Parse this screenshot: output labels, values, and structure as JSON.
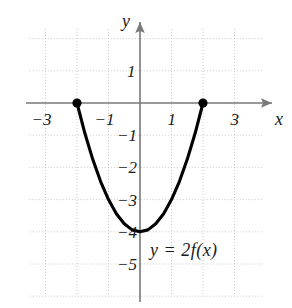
{
  "figure": {
    "title": "",
    "background_color": "#ffffff",
    "curve_color": "#000000",
    "axis_color": "#7a7a7a",
    "grid_color": "#c8c8c8",
    "text_color": "#1a1a1a"
  },
  "labels": {
    "x_axis_name": "x",
    "y_axis_name": "y",
    "curve_equation": "y = 2f(x)"
  },
  "chart_data": {
    "type": "line",
    "title": "",
    "xlabel": "x",
    "ylabel": "y",
    "xlim": [
      -3.5,
      3.9
    ],
    "ylim": [
      -6.0,
      2.3
    ],
    "grid": true,
    "grid_step": 1,
    "legend_position": "none",
    "x_ticks": [
      -3,
      -1,
      1,
      3
    ],
    "x_tick_labels": [
      "-3",
      "-1",
      "1",
      "3"
    ],
    "y_ticks": [
      1,
      -1,
      -2,
      -3,
      -4,
      -5
    ],
    "y_tick_labels": [
      "1",
      "-1",
      "-2",
      "-3",
      "-4",
      "-5"
    ],
    "series": [
      {
        "name": "y = 2f(x)",
        "type": "parabola",
        "domain": [
          -2,
          2
        ],
        "vertex": [
          0,
          -4
        ],
        "equation": "y = x^2 - 4",
        "x": [
          -2,
          -1.75,
          -1.5,
          -1.25,
          -1,
          -0.75,
          -0.5,
          -0.25,
          0,
          0.25,
          0.5,
          0.75,
          1,
          1.25,
          1.5,
          1.75,
          2
        ],
        "values": [
          0,
          -0.94,
          -1.75,
          -2.44,
          -3,
          -3.44,
          -3.75,
          -3.94,
          -4,
          -3.94,
          -3.75,
          -3.44,
          -3,
          -2.44,
          -1.75,
          -0.94,
          0
        ]
      }
    ],
    "points": [
      {
        "name": "left-endpoint",
        "x": -2,
        "y": 0,
        "style": "filled-dot"
      },
      {
        "name": "right-endpoint",
        "x": 2,
        "y": 0,
        "style": "filled-dot"
      }
    ],
    "annotations": [
      {
        "text": "y = 2f(x)",
        "x": 1.0,
        "y": -4.65
      }
    ]
  }
}
